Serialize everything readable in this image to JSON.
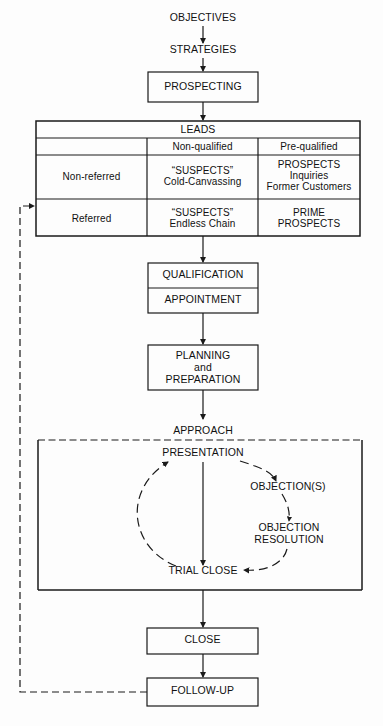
{
  "diagram": {
    "background_color": "#fdfdfd",
    "line_color": "#1a1a1a",
    "text_color": "#111111"
  },
  "flow": {
    "objectives": "OBJECTIVES",
    "strategies": "STRATEGIES",
    "prospecting": "PROSPECTING",
    "qualification": "QUALIFICATION",
    "appointment": "APPOINTMENT",
    "planning": "PLANNING\nand\nPREPARATION",
    "approach": "APPROACH",
    "close": "CLOSE",
    "follow_up": "FOLLOW-UP"
  },
  "leads_table": {
    "title": "LEADS",
    "corner_label": "",
    "column_headers": [
      "Non-qualified",
      "Pre-qualified"
    ],
    "rows": [
      {
        "label": "Non-referred",
        "cells": [
          "“SUSPECTS”\nCold-Canvassing",
          "PROSPECTS\nInquiries\nFormer Customers"
        ]
      },
      {
        "label": "Referred",
        "cells": [
          "“SUSPECTS”\nEndless Chain",
          "PRIME\nPROSPECTS"
        ]
      }
    ]
  },
  "sales_cycle": {
    "presentation": "PRESENTATION",
    "objections": "OBJECTION(S)",
    "objection_resolution": "OBJECTION\nRESOLUTION",
    "trial_close": "TRIAL CLOSE"
  }
}
